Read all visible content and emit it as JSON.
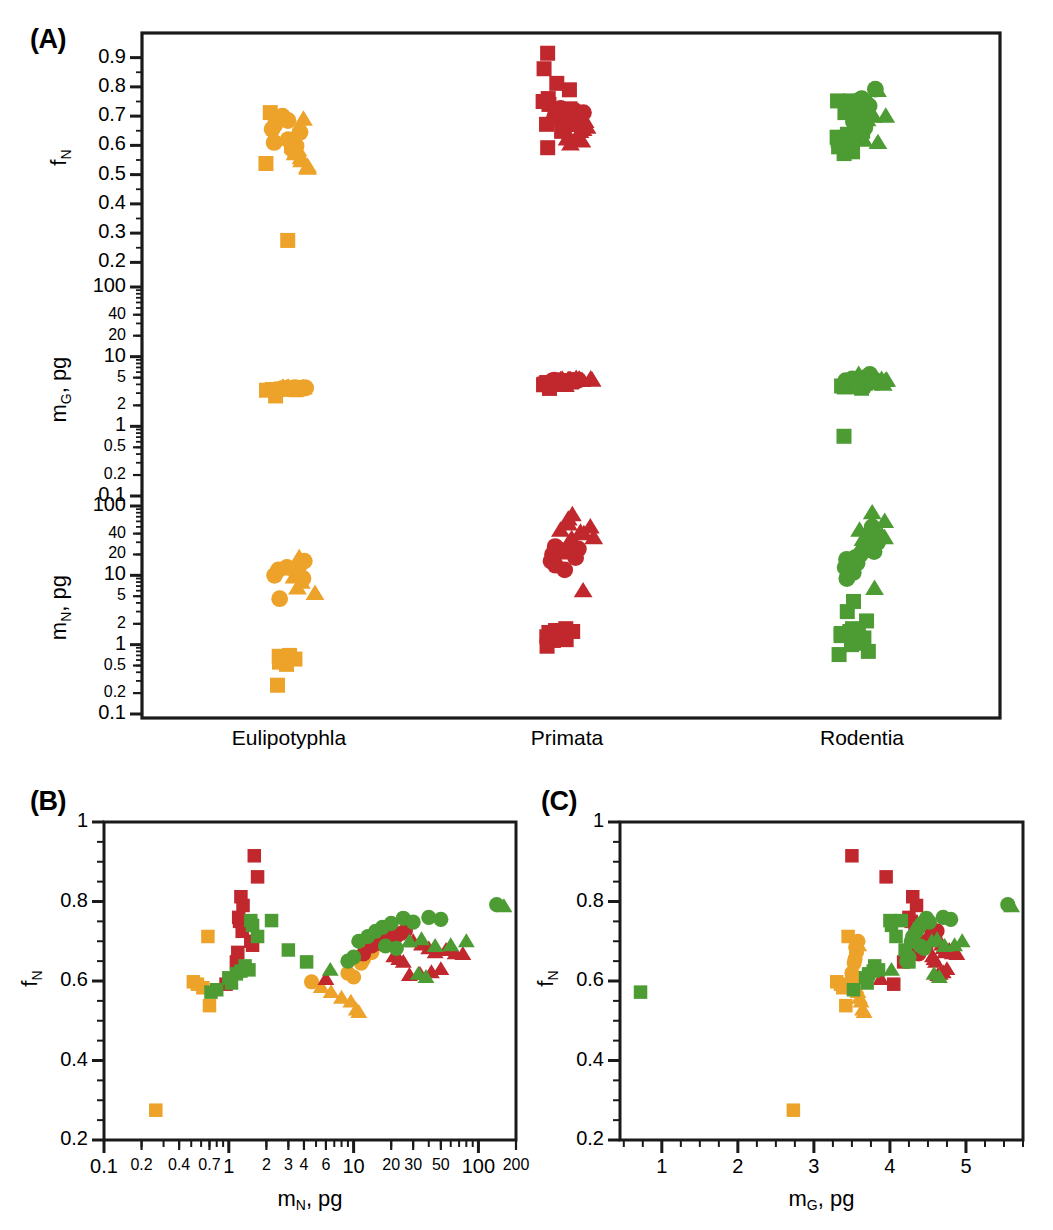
{
  "figure": {
    "panels": [
      {
        "tag": "(A)"
      },
      {
        "tag": "(B)"
      },
      {
        "tag": "(C)"
      }
    ]
  },
  "colors": {
    "eulipotyphla": "#eda229",
    "primata": "#c0282d",
    "rodentia": "#4d9b33",
    "axis": "#1a1a1a",
    "background": "#ffffff"
  },
  "panelA": {
    "tag": "(A)",
    "categories": [
      "Eulipotyphla",
      "Primata",
      "Rodentia"
    ],
    "rows": [
      {
        "key": "fN",
        "axis_label": "f",
        "axis_sub": "N",
        "axis_unit": "",
        "scale": "linear",
        "range": [
          0.15,
          0.95
        ],
        "ticks": [
          "0.9",
          "0.8",
          "0.7",
          "0.6",
          "0.5",
          "0.4",
          "0.3",
          "0.2"
        ],
        "tick_values": [
          0.9,
          0.8,
          0.7,
          0.6,
          0.5,
          0.4,
          0.3,
          0.2
        ]
      },
      {
        "key": "mG",
        "axis_label": "m",
        "axis_sub": "G",
        "axis_unit": ", pg",
        "scale": "log",
        "range": [
          0.1,
          100
        ],
        "ticks": [
          "100",
          "40",
          "20",
          "10",
          "5",
          "2",
          "1",
          "0.5",
          "0.2",
          "0.1"
        ],
        "tick_values": [
          100,
          40,
          20,
          10,
          5,
          2,
          1,
          0.5,
          0.2,
          0.1
        ]
      },
      {
        "key": "mN",
        "axis_label": "m",
        "axis_sub": "N",
        "axis_unit": ", pg",
        "scale": "log",
        "range": [
          0.1,
          100
        ],
        "ticks": [
          "100",
          "40",
          "20",
          "10",
          "5",
          "2",
          "1",
          "0.5",
          "0.2",
          "0.1"
        ],
        "tick_values": [
          100,
          40,
          20,
          10,
          5,
          2,
          1,
          0.5,
          0.2,
          0.1
        ]
      }
    ]
  },
  "panelB": {
    "tag": "(B)",
    "ylabel": "f",
    "ylabel_sub": "N",
    "xlabel": "m",
    "xlabel_sub": "N",
    "xlabel_unit": ", pg",
    "yticks": [
      "1",
      "0.8",
      "0.6",
      "0.4",
      "0.2"
    ],
    "ytick_values": [
      1,
      0.8,
      0.6,
      0.4,
      0.2
    ],
    "xticks": [
      "0.1",
      "0.2",
      "0.4",
      "0.7",
      "1",
      "2",
      "3",
      "4",
      "6",
      "10",
      "20",
      "30",
      "50",
      "100",
      "200"
    ],
    "xtick_values": [
      0.1,
      0.2,
      0.4,
      0.7,
      1,
      2,
      3,
      4,
      6,
      10,
      20,
      30,
      50,
      100,
      200
    ],
    "xscale": "log",
    "yscale": "linear",
    "xlim": [
      0.1,
      200
    ],
    "ylim": [
      0.2,
      1
    ]
  },
  "panelC": {
    "tag": "(C)",
    "ylabel": "f",
    "ylabel_sub": "N",
    "xlabel": "m",
    "xlabel_sub": "G",
    "xlabel_unit": ", pg",
    "yticks": [
      "1",
      "0.8",
      "0.6",
      "0.4",
      "0.2"
    ],
    "ytick_values": [
      1,
      0.8,
      0.6,
      0.4,
      0.2
    ],
    "xticks": [
      "1",
      "2",
      "3",
      "4",
      "5"
    ],
    "xtick_values": [
      1,
      2,
      3,
      4,
      5
    ],
    "xscale": "linear",
    "yscale": "linear",
    "xlim": [
      0.45,
      5.75
    ],
    "ylim": [
      0.2,
      1
    ]
  },
  "chart_data": {
    "type": "scatter",
    "title": "",
    "marker_legend": {
      "square": "square marker",
      "circle": "circle marker",
      "triangle": "triangle marker"
    },
    "group_colors": {
      "Eulipotyphla": "#eda229",
      "Primata": "#c0282d",
      "Rodentia": "#4d9b33"
    },
    "series": [
      {
        "name": "Eulipotyphla",
        "color": "#eda229",
        "points": [
          {
            "mN": 0.26,
            "mG": 2.73,
            "fN": 0.275,
            "marker": "square"
          },
          {
            "mN": 0.52,
            "mG": 3.3,
            "fN": 0.598,
            "marker": "square"
          },
          {
            "mN": 0.56,
            "mG": 3.35,
            "fN": 0.592,
            "marker": "square"
          },
          {
            "mN": 0.62,
            "mG": 3.38,
            "fN": 0.583,
            "marker": "square"
          },
          {
            "mN": 0.7,
            "mG": 3.42,
            "fN": 0.538,
            "marker": "square"
          },
          {
            "mN": 0.68,
            "mG": 3.45,
            "fN": 0.712,
            "marker": "square"
          },
          {
            "mN": 4.6,
            "mG": 3.52,
            "fN": 0.598,
            "marker": "circle"
          },
          {
            "mN": 5.5,
            "mG": 3.55,
            "fN": 0.585,
            "marker": "triangle"
          },
          {
            "mN": 6.6,
            "mG": 3.58,
            "fN": 0.572,
            "marker": "triangle"
          },
          {
            "mN": 8.0,
            "mG": 3.6,
            "fN": 0.558,
            "marker": "triangle"
          },
          {
            "mN": 9.5,
            "mG": 3.62,
            "fN": 0.548,
            "marker": "triangle"
          },
          {
            "mN": 10.5,
            "mG": 3.64,
            "fN": 0.528,
            "marker": "triangle"
          },
          {
            "mN": 11.0,
            "mG": 3.66,
            "fN": 0.522,
            "marker": "triangle"
          },
          {
            "mN": 13.0,
            "mG": 3.55,
            "fN": 0.685,
            "marker": "circle"
          },
          {
            "mN": 14.0,
            "mG": 3.56,
            "fN": 0.672,
            "marker": "circle"
          },
          {
            "mN": 12.0,
            "mG": 3.54,
            "fN": 0.655,
            "marker": "circle"
          },
          {
            "mN": 11.5,
            "mG": 3.53,
            "fN": 0.645,
            "marker": "circle"
          },
          {
            "mN": 16.0,
            "mG": 3.58,
            "fN": 0.7,
            "marker": "circle"
          },
          {
            "mN": 18.0,
            "mG": 3.59,
            "fN": 0.69,
            "marker": "triangle"
          },
          {
            "mN": 9.0,
            "mG": 3.5,
            "fN": 0.62,
            "marker": "circle"
          },
          {
            "mN": 10.0,
            "mG": 3.51,
            "fN": 0.61,
            "marker": "circle"
          }
        ]
      },
      {
        "name": "Primata",
        "color": "#c0282d",
        "points": [
          {
            "mN": 1.6,
            "mG": 3.5,
            "fN": 0.915,
            "marker": "square"
          },
          {
            "mN": 1.7,
            "mG": 3.95,
            "fN": 0.862,
            "marker": "square"
          },
          {
            "mN": 1.25,
            "mG": 4.3,
            "fN": 0.812,
            "marker": "square"
          },
          {
            "mN": 1.3,
            "mG": 4.35,
            "fN": 0.79,
            "marker": "square"
          },
          {
            "mN": 1.2,
            "mG": 4.25,
            "fN": 0.76,
            "marker": "square"
          },
          {
            "mN": 1.22,
            "mG": 4.28,
            "fN": 0.75,
            "marker": "square"
          },
          {
            "mN": 1.35,
            "mG": 4.4,
            "fN": 0.74,
            "marker": "square"
          },
          {
            "mN": 1.28,
            "mG": 4.33,
            "fN": 0.725,
            "marker": "square"
          },
          {
            "mN": 1.5,
            "mG": 4.45,
            "fN": 0.7,
            "marker": "square"
          },
          {
            "mN": 1.55,
            "mG": 4.48,
            "fN": 0.69,
            "marker": "square"
          },
          {
            "mN": 1.18,
            "mG": 4.22,
            "fN": 0.672,
            "marker": "square"
          },
          {
            "mN": 1.15,
            "mG": 4.18,
            "fN": 0.648,
            "marker": "square"
          },
          {
            "mN": 0.95,
            "mG": 4.05,
            "fN": 0.592,
            "marker": "square"
          },
          {
            "mN": 20.0,
            "mG": 4.55,
            "fN": 0.718,
            "marker": "circle"
          },
          {
            "mN": 22.0,
            "mG": 4.58,
            "fN": 0.712,
            "marker": "circle"
          },
          {
            "mN": 18.0,
            "mG": 4.52,
            "fN": 0.705,
            "marker": "circle"
          },
          {
            "mN": 16.0,
            "mG": 4.48,
            "fN": 0.695,
            "marker": "circle"
          },
          {
            "mN": 24.0,
            "mG": 4.6,
            "fN": 0.72,
            "marker": "circle"
          },
          {
            "mN": 14.0,
            "mG": 4.42,
            "fN": 0.688,
            "marker": "circle"
          },
          {
            "mN": 12.0,
            "mG": 4.38,
            "fN": 0.668,
            "marker": "circle"
          },
          {
            "mN": 26.0,
            "mG": 4.62,
            "fN": 0.726,
            "marker": "circle"
          },
          {
            "mN": 30.0,
            "mG": 4.65,
            "fN": 0.7,
            "marker": "triangle"
          },
          {
            "mN": 35.0,
            "mG": 4.68,
            "fN": 0.692,
            "marker": "triangle"
          },
          {
            "mN": 40.0,
            "mG": 4.7,
            "fN": 0.682,
            "marker": "triangle"
          },
          {
            "mN": 45.0,
            "mG": 4.72,
            "fN": 0.672,
            "marker": "triangle"
          },
          {
            "mN": 55.0,
            "mG": 4.78,
            "fN": 0.678,
            "marker": "triangle"
          },
          {
            "mN": 65.0,
            "mG": 4.82,
            "fN": 0.67,
            "marker": "triangle"
          },
          {
            "mN": 75.0,
            "mG": 4.88,
            "fN": 0.668,
            "marker": "triangle"
          },
          {
            "mN": 50.0,
            "mG": 4.75,
            "fN": 0.63,
            "marker": "triangle"
          },
          {
            "mN": 42.0,
            "mG": 4.7,
            "fN": 0.622,
            "marker": "triangle"
          },
          {
            "mN": 34.0,
            "mG": 4.66,
            "fN": 0.618,
            "marker": "triangle"
          },
          {
            "mN": 28.0,
            "mG": 4.63,
            "fN": 0.615,
            "marker": "triangle"
          },
          {
            "mN": 6.0,
            "mG": 3.88,
            "fN": 0.605,
            "marker": "triangle"
          },
          {
            "mN": 21.0,
            "mG": 4.56,
            "fN": 0.662,
            "marker": "triangle"
          },
          {
            "mN": 23.0,
            "mG": 4.58,
            "fN": 0.655,
            "marker": "triangle"
          },
          {
            "mN": 25.0,
            "mG": 4.6,
            "fN": 0.648,
            "marker": "triangle"
          }
        ]
      },
      {
        "name": "Rodentia",
        "color": "#4d9b33",
        "points": [
          {
            "mN": 0.72,
            "mG": 0.72,
            "fN": 0.572,
            "marker": "square"
          },
          {
            "mN": 0.8,
            "mG": 3.52,
            "fN": 0.578,
            "marker": "square"
          },
          {
            "mN": 1.0,
            "mG": 3.68,
            "fN": 0.608,
            "marker": "square"
          },
          {
            "mN": 1.15,
            "mG": 3.72,
            "fN": 0.618,
            "marker": "square"
          },
          {
            "mN": 1.25,
            "mG": 3.78,
            "fN": 0.625,
            "marker": "square"
          },
          {
            "mN": 1.35,
            "mG": 3.8,
            "fN": 0.638,
            "marker": "square"
          },
          {
            "mN": 1.45,
            "mG": 3.85,
            "fN": 0.628,
            "marker": "square"
          },
          {
            "mN": 1.5,
            "mG": 4.0,
            "fN": 0.752,
            "marker": "square"
          },
          {
            "mN": 1.55,
            "mG": 4.02,
            "fN": 0.74,
            "marker": "square"
          },
          {
            "mN": 1.7,
            "mG": 4.08,
            "fN": 0.712,
            "marker": "square"
          },
          {
            "mN": 2.2,
            "mG": 4.15,
            "fN": 0.752,
            "marker": "square"
          },
          {
            "mN": 3.0,
            "mG": 4.2,
            "fN": 0.678,
            "marker": "square"
          },
          {
            "mN": 4.2,
            "mG": 4.25,
            "fN": 0.648,
            "marker": "square"
          },
          {
            "mN": 13.0,
            "mG": 4.3,
            "fN": 0.712,
            "marker": "circle"
          },
          {
            "mN": 11.0,
            "mG": 4.28,
            "fN": 0.7,
            "marker": "circle"
          },
          {
            "mN": 15.0,
            "mG": 4.35,
            "fN": 0.725,
            "marker": "circle"
          },
          {
            "mN": 17.0,
            "mG": 4.38,
            "fN": 0.735,
            "marker": "circle"
          },
          {
            "mN": 20.0,
            "mG": 4.42,
            "fN": 0.745,
            "marker": "circle"
          },
          {
            "mN": 25.0,
            "mG": 4.48,
            "fN": 0.758,
            "marker": "circle"
          },
          {
            "mN": 30.0,
            "mG": 4.52,
            "fN": 0.748,
            "marker": "circle"
          },
          {
            "mN": 40.0,
            "mG": 4.7,
            "fN": 0.76,
            "marker": "circle"
          },
          {
            "mN": 50.0,
            "mG": 4.8,
            "fN": 0.755,
            "marker": "circle"
          },
          {
            "mN": 140.0,
            "mG": 5.55,
            "fN": 0.792,
            "marker": "circle"
          },
          {
            "mN": 160.0,
            "mG": 5.6,
            "fN": 0.788,
            "marker": "triangle"
          },
          {
            "mN": 18.0,
            "mG": 4.4,
            "fN": 0.688,
            "marker": "circle"
          },
          {
            "mN": 22.0,
            "mG": 4.45,
            "fN": 0.682,
            "marker": "circle"
          },
          {
            "mN": 10.0,
            "mG": 4.25,
            "fN": 0.66,
            "marker": "circle"
          },
          {
            "mN": 9.0,
            "mG": 4.22,
            "fN": 0.65,
            "marker": "circle"
          },
          {
            "mN": 6.5,
            "mG": 4.02,
            "fN": 0.628,
            "marker": "triangle"
          },
          {
            "mN": 28.0,
            "mG": 4.55,
            "fN": 0.7,
            "marker": "triangle"
          },
          {
            "mN": 35.0,
            "mG": 4.62,
            "fN": 0.705,
            "marker": "triangle"
          },
          {
            "mN": 45.0,
            "mG": 4.72,
            "fN": 0.688,
            "marker": "triangle"
          },
          {
            "mN": 60.0,
            "mG": 4.85,
            "fN": 0.69,
            "marker": "triangle"
          },
          {
            "mN": 80.0,
            "mG": 4.95,
            "fN": 0.7,
            "marker": "triangle"
          },
          {
            "mN": 33.0,
            "mG": 4.58,
            "fN": 0.618,
            "marker": "triangle"
          },
          {
            "mN": 38.0,
            "mG": 4.65,
            "fN": 0.61,
            "marker": "triangle"
          },
          {
            "mN": 1.05,
            "mG": 3.7,
            "fN": 0.595,
            "marker": "square"
          }
        ]
      }
    ]
  }
}
